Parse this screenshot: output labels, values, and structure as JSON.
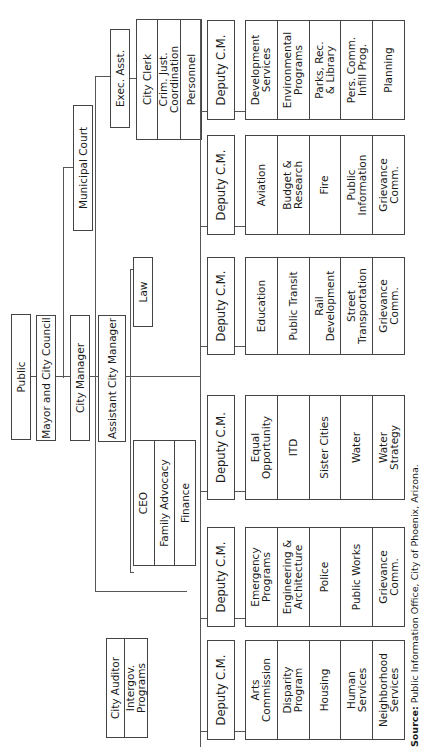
{
  "chart": {
    "top": [
      "Public",
      "Mayor and City Council",
      "City Manager",
      "Assistant City Manager"
    ],
    "law": "Law",
    "municipal_court": "Municipal Court",
    "exec_asst": "Exec. Asst.",
    "city_clerk_group": [
      "City Clerk",
      "Crim. Just. Coordination",
      "Personnel"
    ],
    "ceo_group": [
      "CEO",
      "Family Advocacy",
      "Finance"
    ],
    "auditor_group": [
      "City Auditor",
      "Intergov. Programs"
    ],
    "deputies": [
      {
        "label": "Deputy C.M.",
        "departments": [
          "Arts\nCommission",
          "Disparity\nProgram",
          "Housing",
          "Human\nServices",
          "Neighborhood\nServices"
        ]
      },
      {
        "label": "Deputy C.M.",
        "departments": [
          "Emergency\nPrograms",
          "Engineering &\nArchitecture",
          "Police",
          "Public Works",
          "Grievance\nComm."
        ]
      },
      {
        "label": "Deputy C.M.",
        "departments": [
          "Equal\nOpportunity",
          "ITD",
          "Sister Cities",
          "Water",
          "Water\nStrategy"
        ]
      },
      {
        "label": "Deputy C.M.",
        "departments": [
          "Education",
          "Public Transit",
          "Rail\nDevelopment",
          "Street\nTransportation",
          "Grievance\nComm."
        ]
      },
      {
        "label": "Deputy C.M.",
        "departments": [
          "Aviation",
          "Budget &\nResearch",
          "Fire",
          "Public\nInformation",
          "Grievance\nComm."
        ]
      },
      {
        "label": "Deputy C.M.",
        "departments": [
          "Development\nServices",
          "Environmental\nPrograms",
          "Parks, Rec.\n& Library",
          "Pers. Comm.\nInfill Prog.",
          "Planning"
        ]
      }
    ],
    "source_label": "Source:",
    "source_text": " Public Information Office, City of Phoenix, Arizona."
  }
}
